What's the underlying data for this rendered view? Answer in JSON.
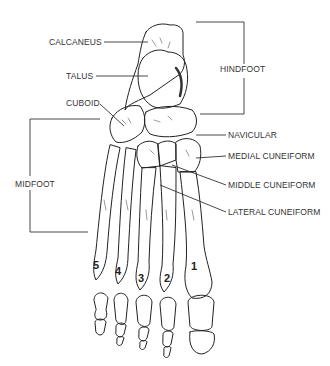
{
  "figure": {
    "regions": {
      "hindfoot": "HINDFOOT",
      "midfoot": "MIDFOOT"
    },
    "labels": {
      "calcaneus": "CALCANEUS",
      "talus": "TALUS",
      "cuboid": "CUBOID",
      "navicular": "NAVICULAR",
      "medial_cuneiform": "MEDIAL CUNEIFORM",
      "middle_cuneiform": "MIDDLE CUNEIFORM",
      "lateral_cuneiform": "LATERAL CUNEIFORM"
    },
    "digits": [
      "1",
      "2",
      "3",
      "4",
      "5"
    ],
    "colors": {
      "line": "#222222",
      "text": "#333333",
      "background": "#ffffff"
    }
  }
}
